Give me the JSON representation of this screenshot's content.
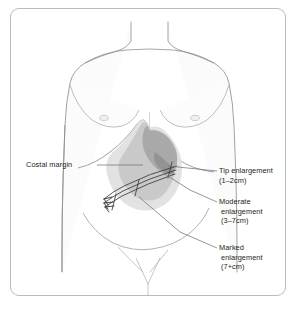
{
  "figure": {
    "type": "anatomical-diagram",
    "border_color": "#b9bcbe",
    "background_color": "#ffffff"
  },
  "body": {
    "outline_color": "#8d9195",
    "fill_color": "#fbfbfb",
    "parts": [
      "neck",
      "shoulders",
      "chest",
      "left-nipple",
      "right-nipple",
      "costal-margin",
      "abdomen",
      "iliac-crest",
      "pubic-region"
    ]
  },
  "liver_zones": [
    {
      "name": "tip-enlargement",
      "label": "Tip enlargement",
      "measure": "(1–2cm)",
      "shade": "#a8a8a8",
      "order": 1
    },
    {
      "name": "moderate-enlargement",
      "label": "Moderate",
      "label_line2": "enlargement",
      "measure": "(3–7cm)",
      "shade": "#c3c3c3",
      "order": 2
    },
    {
      "name": "marked-enlargement",
      "label": "Marked",
      "label_line2": "enlargement",
      "measure": "(7+cm)",
      "shade": "#dcdcdc",
      "order": 3
    }
  ],
  "labels": {
    "costal_margin": "Costal margin",
    "tip": {
      "line1": "Tip enlargement",
      "line2": "(1–2cm)"
    },
    "moderate": {
      "line1": "Moderate",
      "line2": "enlargement",
      "line3": "(3–7cm)"
    },
    "marked": {
      "line1": "Marked",
      "line2": "enlargement",
      "line3": "(7+cm)"
    }
  },
  "annotations": {
    "leader_line_color": "#6f7478",
    "arrow_color": "#3a3a3a",
    "text_color": "#231f20",
    "arrow_count": 3,
    "arrow_direction": "down-left"
  }
}
